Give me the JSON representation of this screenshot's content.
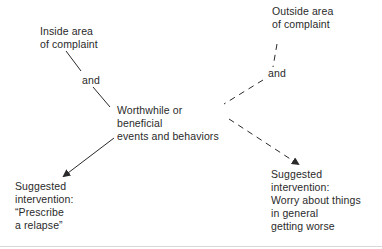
{
  "diagram": {
    "nodes": {
      "inside_area": "Inside area\nof complaint",
      "outside_area": "Outside area\nof complaint",
      "and_left": "and",
      "and_right": "and",
      "worthwhile": "Worthwhile or\nbeneficial\nevents and behaviors",
      "intervention_left": "Suggested\nintervention:\n“Prescribe\na relapse”",
      "intervention_right": "Suggested\nintervention:\nWorry about things\nin general\ngetting worse"
    },
    "edges": [
      {
        "from": "inside_area",
        "to": "and_left",
        "style": "solid"
      },
      {
        "from": "and_left",
        "to": "worthwhile",
        "style": "solid"
      },
      {
        "from": "worthwhile",
        "to": "intervention_left",
        "style": "solid-arrow"
      },
      {
        "from": "outside_area",
        "to": "and_right",
        "style": "dashed"
      },
      {
        "from": "and_right",
        "to": "worthwhile",
        "style": "dashed"
      },
      {
        "from": "worthwhile",
        "to": "intervention_right",
        "style": "dashed-arrow"
      }
    ]
  }
}
